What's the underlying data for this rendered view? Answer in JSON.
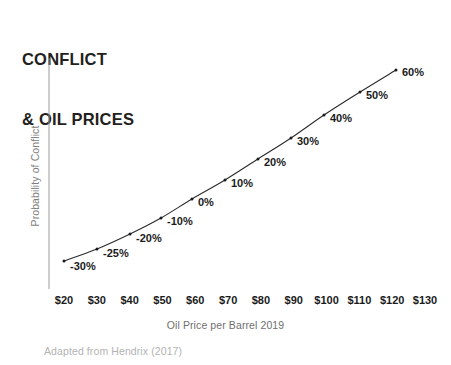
{
  "title": {
    "line1": "CONFLICT",
    "line2": "& OIL PRICES"
  },
  "source_note": "Adapted from Hendrix (2017)",
  "colors": {
    "background": "#ffffff",
    "title_text": "#231f20",
    "tick_text": "#1b1b1b",
    "axis_label_text": "#6f6f6f",
    "source_text": "#b3b3b3",
    "axis_line": "#9a9a9a",
    "curve_line": "#2b2b2b",
    "point_marker": "#1b1b1b"
  },
  "chart_data": {
    "type": "line",
    "title": "CONFLICT & OIL PRICES",
    "xlabel": "Oil Price per Barrel 2019",
    "ylabel": "Probability of Conflict",
    "grid": false,
    "legend": false,
    "legend_position": "none",
    "x_axis_line": false,
    "y_axis_line": true,
    "y_tick_labels": [],
    "xlim": [
      20,
      130
    ],
    "x_tick_labels": [
      "$20",
      "$30",
      "$40",
      "$50",
      "$60",
      "$70",
      "$80",
      "$90",
      "$100",
      "$110",
      "$120",
      "$130"
    ],
    "x_tick_values": [
      20,
      30,
      40,
      50,
      60,
      70,
      80,
      90,
      100,
      110,
      120,
      130
    ],
    "x": [
      20,
      30,
      40,
      50,
      60,
      70,
      80,
      90,
      100,
      110,
      121
    ],
    "point_labels": [
      "-30%",
      "-25%",
      "-20%",
      "-10%",
      "0%",
      "10%",
      "20%",
      "30%",
      "40%",
      "50%",
      "60%"
    ],
    "values": [
      -30,
      -25,
      -20,
      -10,
      0,
      10,
      20,
      30,
      40,
      50,
      60
    ],
    "value_unit": "%",
    "value_meaning": "percent change in probability of conflict",
    "points_px": [
      {
        "x": 64,
        "y": 261,
        "label": "-30%",
        "lx": 70,
        "ly": 260
      },
      {
        "x": 97,
        "y": 249,
        "label": "-25%",
        "lx": 103,
        "ly": 247
      },
      {
        "x": 130,
        "y": 234,
        "label": "-20%",
        "lx": 136,
        "ly": 232
      },
      {
        "x": 161,
        "y": 218,
        "label": "-10%",
        "lx": 167,
        "ly": 215
      },
      {
        "x": 192,
        "y": 199,
        "label": "0%",
        "lx": 198,
        "ly": 196
      },
      {
        "x": 225,
        "y": 180,
        "label": "10%",
        "lx": 231,
        "ly": 177
      },
      {
        "x": 258,
        "y": 159,
        "label": "20%",
        "lx": 264,
        "ly": 156
      },
      {
        "x": 291,
        "y": 138,
        "label": "30%",
        "lx": 297,
        "ly": 135
      },
      {
        "x": 324,
        "y": 115,
        "label": "40%",
        "lx": 330,
        "ly": 112
      },
      {
        "x": 360,
        "y": 92,
        "label": "50%",
        "lx": 366,
        "ly": 89
      },
      {
        "x": 396,
        "y": 70,
        "label": "60%",
        "lx": 402,
        "ly": 66
      }
    ]
  }
}
